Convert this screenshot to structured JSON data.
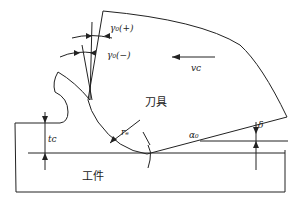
{
  "diagram": {
    "labels": {
      "rake_positive": "γ₀(+)",
      "rake_negative": "γ₀(−)",
      "cutting_speed": "vᴄ",
      "tool": "刀具",
      "workpiece": "工件",
      "chip_thickness": "tᴄ",
      "nose_radius": "rₑ",
      "clearance_angle": "α₀",
      "delta": "δ"
    },
    "colors": {
      "line": "#222222",
      "background": "#ffffff"
    }
  }
}
